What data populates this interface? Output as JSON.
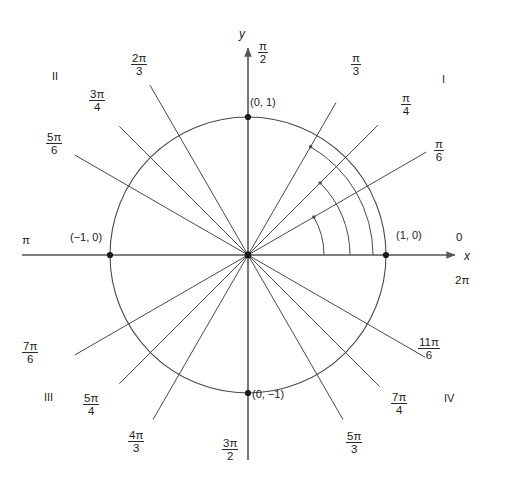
{
  "figure": {
    "type": "unit-circle-diagram",
    "colors": {
      "line": "#4a4a4a",
      "axis": "#555555",
      "text": "#1c1c1c",
      "background": "#ffffff",
      "point": "#1a1a1a"
    },
    "geometry": {
      "origin_x": 248,
      "origin_y": 255,
      "radius": 138
    }
  },
  "axes": {
    "x_label": "x",
    "y_label": "y"
  },
  "quadrants": [
    {
      "name": "I",
      "label": "I"
    },
    {
      "name": "II",
      "label": "II"
    },
    {
      "name": "III",
      "label": "III"
    },
    {
      "name": "IV",
      "label": "IV"
    }
  ],
  "points": [
    {
      "name": "point-1-0",
      "label": "(1, 0)"
    },
    {
      "name": "point-0-1",
      "label": "(0, 1)"
    },
    {
      "name": "point-neg1-0",
      "label": "(−1, 0)"
    },
    {
      "name": "point-0-neg1",
      "label": "(0, −1)"
    }
  ],
  "plain_angles": [
    {
      "name": "angle-zero",
      "label": "0"
    },
    {
      "name": "angle-two-pi",
      "label": "2π"
    },
    {
      "name": "angle-pi",
      "label": "π"
    }
  ],
  "angles": [
    {
      "name": "angle-pi-over-6",
      "num": "π",
      "den": "6",
      "deg": 30
    },
    {
      "name": "angle-pi-over-4",
      "num": "π",
      "den": "4",
      "deg": 45
    },
    {
      "name": "angle-pi-over-3",
      "num": "π",
      "den": "3",
      "deg": 60
    },
    {
      "name": "angle-pi-over-2",
      "num": "π",
      "den": "2",
      "deg": 90
    },
    {
      "name": "angle-2pi-over-3",
      "num": "2π",
      "den": "3",
      "deg": 120
    },
    {
      "name": "angle-3pi-over-4",
      "num": "3π",
      "den": "4",
      "deg": 135
    },
    {
      "name": "angle-5pi-over-6",
      "num": "5π",
      "den": "6",
      "deg": 150
    },
    {
      "name": "angle-7pi-over-6",
      "num": "7π",
      "den": "6",
      "deg": 210
    },
    {
      "name": "angle-5pi-over-4",
      "num": "5π",
      "den": "4",
      "deg": 225
    },
    {
      "name": "angle-4pi-over-3",
      "num": "4π",
      "den": "3",
      "deg": 240
    },
    {
      "name": "angle-3pi-over-2",
      "num": "3π",
      "den": "2",
      "deg": 270
    },
    {
      "name": "angle-5pi-over-3",
      "num": "5π",
      "den": "3",
      "deg": 300
    },
    {
      "name": "angle-7pi-over-4",
      "num": "7π",
      "den": "4",
      "deg": 315
    },
    {
      "name": "angle-11pi-over-6",
      "num": "11π",
      "den": "6",
      "deg": 330
    }
  ],
  "arcs": [
    {
      "name": "arc-to-pi-over-6",
      "radius": 76,
      "end_deg": 30
    },
    {
      "name": "arc-to-pi-over-4",
      "radius": 102,
      "end_deg": 45
    },
    {
      "name": "arc-to-pi-over-3",
      "radius": 125,
      "end_deg": 60
    }
  ]
}
